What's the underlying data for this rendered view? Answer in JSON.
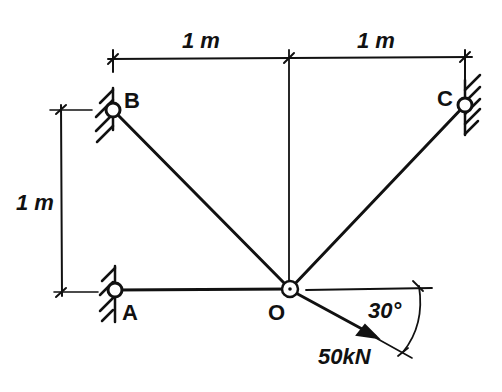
{
  "diagram": {
    "type": "truss-statics",
    "nodes": {
      "A": {
        "label": "A",
        "support": "pinned-wall-left"
      },
      "B": {
        "label": "B",
        "support": "pinned-wall-left"
      },
      "C": {
        "label": "C",
        "support": "pinned-wall-right"
      },
      "O": {
        "label": "O",
        "support": "free-joint"
      }
    },
    "members": [
      "AO",
      "BO",
      "CO"
    ],
    "dimensions": {
      "top_left": "1 m",
      "top_right": "1 m",
      "left_vertical": "1 m"
    },
    "load": {
      "magnitude": "50kN",
      "angle": "30°",
      "at_node": "O"
    },
    "colors": {
      "ink": "#111111",
      "background": "#ffffff"
    }
  }
}
